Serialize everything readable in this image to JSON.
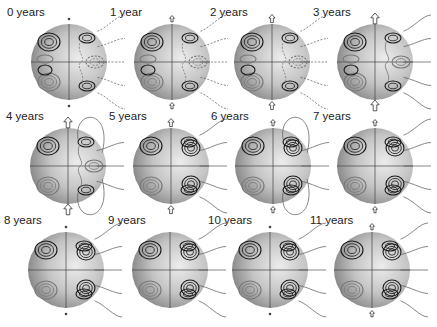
{
  "figure": {
    "title": "",
    "panels": [
      {
        "label": "0 years",
        "arrow": "dot",
        "field": "dashed"
      },
      {
        "label": "1 year",
        "arrow": "small",
        "field": "dashed"
      },
      {
        "label": "2 years",
        "arrow": "medium",
        "field": "dashed"
      },
      {
        "label": "3 years",
        "arrow": "large",
        "field": "mixed"
      },
      {
        "label": "4 years",
        "arrow": "large",
        "field": "loops"
      },
      {
        "label": "5 years",
        "arrow": "medium",
        "field": "open"
      },
      {
        "label": "6 years",
        "arrow": "small",
        "field": "loops"
      },
      {
        "label": "7 years",
        "arrow": "small",
        "field": "open"
      },
      {
        "label": "8 years",
        "arrow": "dot",
        "field": "open"
      },
      {
        "label": "9 years",
        "arrow": "none",
        "field": "open"
      },
      {
        "label": "10 years",
        "arrow": "dot",
        "field": "open"
      },
      {
        "label": "11 years",
        "arrow": "small",
        "field": "open"
      }
    ],
    "colors": {
      "sphere_light": "#e4e4e4",
      "sphere_dark": "#8a8a8a",
      "contour_dark": "#1a1a1a",
      "contour_light": "#777777",
      "field_line": "#555555",
      "text": "#222222"
    }
  }
}
